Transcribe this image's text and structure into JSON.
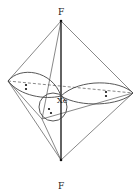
{
  "diagram": {
    "labels": {
      "top_atom": "F",
      "bottom_atom": "F",
      "central_atom": "Xe"
    },
    "lone_pairs": 3,
    "colors": {
      "line": "#333333",
      "background": "#ffffff"
    }
  }
}
